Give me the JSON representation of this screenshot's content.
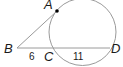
{
  "diagram": {
    "type": "circle-tangent-secant",
    "points": {
      "A": {
        "label": "A"
      },
      "B": {
        "label": "B"
      },
      "C": {
        "label": "C"
      },
      "D": {
        "label": "D"
      }
    },
    "segments": {
      "BC": {
        "label": "6"
      },
      "CD": {
        "label": "11"
      }
    },
    "colors": {
      "stroke": "#999999",
      "text": "#1a1a1a",
      "point": "#000000"
    }
  }
}
